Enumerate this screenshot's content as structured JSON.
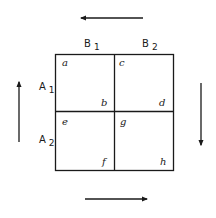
{
  "diagram": {
    "type": "2x2 grid with circulating arrows",
    "stroke_color": "#1a1a1a",
    "background": "#ffffff",
    "column_headers": [
      {
        "main": "B",
        "sub": "1"
      },
      {
        "main": "B",
        "sub": "2"
      }
    ],
    "row_headers": [
      {
        "main": "A",
        "sub": "1"
      },
      {
        "main": "A",
        "sub": "2"
      }
    ],
    "cells": [
      {
        "row": 1,
        "col": 1,
        "top_left": "a",
        "bottom_right": "b"
      },
      {
        "row": 1,
        "col": 2,
        "top_left": "c",
        "bottom_right": "d"
      },
      {
        "row": 2,
        "col": 1,
        "top_left": "e",
        "bottom_right": "f"
      },
      {
        "row": 2,
        "col": 2,
        "top_left": "g",
        "bottom_right": "h"
      }
    ],
    "arrows": [
      {
        "position": "top",
        "direction": "left"
      },
      {
        "position": "right",
        "direction": "down"
      },
      {
        "position": "bottom",
        "direction": "right"
      },
      {
        "position": "left",
        "direction": "up"
      }
    ]
  }
}
